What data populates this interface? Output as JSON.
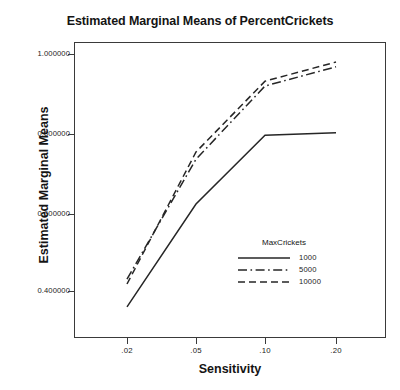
{
  "chart_data": {
    "type": "line",
    "title": "Estimated Marginal Means of PercentCrickets",
    "xlabel": "Sensitivity",
    "ylabel": "Estimated Marginal Means",
    "categories": [
      ".02",
      ".05",
      ".10",
      ".20"
    ],
    "x_tick_labels": [
      ".02",
      ".05",
      ".10",
      ".20"
    ],
    "y_tick_labels": [
      "1.000000",
      "0.800000",
      "0.600000",
      "0.400000"
    ],
    "y_tick_values": [
      1.0,
      0.8,
      0.6,
      0.4
    ],
    "ylim": [
      0.32,
      1.04
    ],
    "grid": false,
    "legend_title": "MaxCrickets",
    "legend_position": "inside-lower-right",
    "series": [
      {
        "name": "1000",
        "style": "solid",
        "values": [
          0.368,
          0.625,
          0.797,
          0.803
        ]
      },
      {
        "name": "5000",
        "style": "dash-dot",
        "values": [
          0.437,
          0.737,
          0.92,
          0.968
        ]
      },
      {
        "name": "10000",
        "style": "dashed",
        "values": [
          0.425,
          0.755,
          0.932,
          0.98
        ]
      }
    ],
    "line_color": "#262626"
  },
  "axes": {
    "y_ticks": [
      {
        "label": "1.000000",
        "y": 54
      },
      {
        "label": "0.800000",
        "y": 134
      },
      {
        "label": "0.600000",
        "y": 214
      },
      {
        "label": "0.400000",
        "y": 291
      }
    ],
    "x_ticks": [
      {
        "label": ".02",
        "x": 127
      },
      {
        "label": ".05",
        "x": 196
      },
      {
        "label": ".10",
        "x": 265
      },
      {
        "label": ".20",
        "x": 336
      }
    ]
  },
  "legend": {
    "title": "MaxCrickets",
    "items": [
      {
        "label": "1000",
        "style": "solid"
      },
      {
        "label": "5000",
        "style": "dash-dot"
      },
      {
        "label": "10000",
        "style": "dashed"
      }
    ]
  }
}
